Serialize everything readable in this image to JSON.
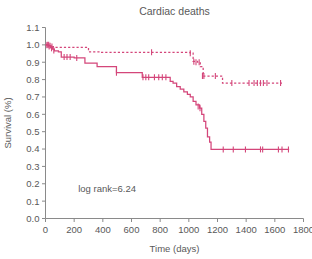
{
  "chart_data": {
    "type": "line",
    "title": "Cardiac deaths",
    "xlabel": "Time (days)",
    "ylabel": "Survival (%)",
    "xlim": [
      0,
      1800
    ],
    "ylim": [
      0.0,
      1.1
    ],
    "xticks": [
      0,
      200,
      400,
      600,
      800,
      1000,
      1200,
      1400,
      1600,
      1800
    ],
    "yticks": [
      0.0,
      0.1,
      0.2,
      0.3,
      0.4,
      0.5,
      0.6,
      0.7,
      0.8,
      0.9,
      1.0,
      1.1
    ],
    "xticklabels": [
      "0",
      "200",
      "400",
      "600",
      "800",
      "1000",
      "1200",
      "1400",
      "1600",
      "1800"
    ],
    "yticklabels": [
      "0.0",
      "0.1",
      "0.2",
      "0.3",
      "0.4",
      "0.5",
      "0.6",
      "0.7",
      "0.8",
      "0.9",
      "1.0",
      "1.1"
    ],
    "grid": false,
    "legend": "none",
    "annotations": [
      {
        "text": "log rank=6.24",
        "x": 430,
        "y": 0.155
      }
    ],
    "line_color": "#d4467a",
    "series": [
      {
        "name": "dashed-group",
        "style": "dashed",
        "color": "#d4467a",
        "steps": [
          [
            0,
            1.0
          ],
          [
            18,
            1.0
          ],
          [
            28,
            0.995
          ],
          [
            40,
            0.99
          ],
          [
            55,
            0.985
          ],
          [
            270,
            0.985
          ],
          [
            300,
            0.96
          ],
          [
            380,
            0.957
          ],
          [
            740,
            0.957
          ],
          [
            1010,
            0.952
          ],
          [
            1030,
            0.905
          ],
          [
            1060,
            0.9
          ],
          [
            1080,
            0.875
          ],
          [
            1100,
            0.82
          ],
          [
            1215,
            0.82
          ],
          [
            1235,
            0.78
          ],
          [
            1650,
            0.78
          ]
        ],
        "censor_points": [
          [
            12,
            1.0
          ],
          [
            22,
            1.0
          ],
          [
            32,
            0.995
          ],
          [
            45,
            0.99
          ],
          [
            740,
            0.957
          ],
          [
            1010,
            0.952
          ],
          [
            1035,
            0.903
          ],
          [
            1050,
            0.9
          ],
          [
            1072,
            0.9
          ],
          [
            1095,
            0.82
          ],
          [
            1105,
            0.82
          ],
          [
            1185,
            0.82
          ],
          [
            1300,
            0.78
          ],
          [
            1420,
            0.78
          ],
          [
            1455,
            0.78
          ],
          [
            1478,
            0.78
          ],
          [
            1500,
            0.78
          ],
          [
            1520,
            0.78
          ],
          [
            1545,
            0.78
          ],
          [
            1640,
            0.78
          ]
        ]
      },
      {
        "name": "solid-group",
        "style": "solid",
        "color": "#d4467a",
        "steps": [
          [
            0,
            1.0
          ],
          [
            20,
            0.995
          ],
          [
            35,
            0.985
          ],
          [
            50,
            0.975
          ],
          [
            62,
            0.965
          ],
          [
            90,
            0.96
          ],
          [
            110,
            0.93
          ],
          [
            185,
            0.93
          ],
          [
            200,
            0.925
          ],
          [
            255,
            0.925
          ],
          [
            275,
            0.895
          ],
          [
            345,
            0.895
          ],
          [
            360,
            0.875
          ],
          [
            480,
            0.875
          ],
          [
            495,
            0.84
          ],
          [
            660,
            0.84
          ],
          [
            675,
            0.813
          ],
          [
            855,
            0.813
          ],
          [
            870,
            0.79
          ],
          [
            890,
            0.78
          ],
          [
            915,
            0.76
          ],
          [
            940,
            0.745
          ],
          [
            965,
            0.73
          ],
          [
            990,
            0.715
          ],
          [
            1010,
            0.7
          ],
          [
            1030,
            0.675
          ],
          [
            1050,
            0.655
          ],
          [
            1075,
            0.635
          ],
          [
            1090,
            0.6
          ],
          [
            1105,
            0.56
          ],
          [
            1118,
            0.52
          ],
          [
            1130,
            0.47
          ],
          [
            1145,
            0.44
          ],
          [
            1155,
            0.398
          ],
          [
            1700,
            0.398
          ]
        ],
        "censor_points": [
          [
            10,
            0.998
          ],
          [
            25,
            0.99
          ],
          [
            42,
            0.98
          ],
          [
            58,
            0.968
          ],
          [
            130,
            0.93
          ],
          [
            150,
            0.93
          ],
          [
            172,
            0.93
          ],
          [
            218,
            0.925
          ],
          [
            495,
            0.84
          ],
          [
            680,
            0.813
          ],
          [
            700,
            0.813
          ],
          [
            720,
            0.813
          ],
          [
            760,
            0.813
          ],
          [
            790,
            0.813
          ],
          [
            815,
            0.813
          ],
          [
            840,
            0.813
          ],
          [
            1065,
            0.645
          ],
          [
            1078,
            0.635
          ],
          [
            1240,
            0.398
          ],
          [
            1310,
            0.398
          ],
          [
            1395,
            0.398
          ],
          [
            1500,
            0.398
          ],
          [
            1515,
            0.398
          ],
          [
            1625,
            0.398
          ],
          [
            1650,
            0.398
          ],
          [
            1695,
            0.398
          ]
        ]
      }
    ]
  },
  "axis": {
    "title_text": "Cardiac deaths",
    "x_axis_title": "Time (days)",
    "y_axis_title": "Survival (%)"
  }
}
